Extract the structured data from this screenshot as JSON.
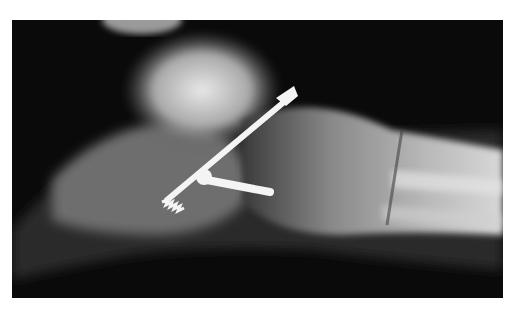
{
  "image": {
    "subject": "lateral foot radiograph with two orthopedic screws",
    "description": "X-ray of ankle/foot in lateral view showing one long lag screw and one short screw fixation",
    "colors": {
      "background": "#ffffff",
      "film": "#0a0a0a",
      "bone": "#bdbdbd",
      "hardware": "#f4f4f4"
    }
  }
}
